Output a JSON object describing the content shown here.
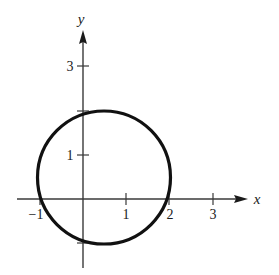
{
  "figure": {
    "colors": {
      "axis": "#3a3a3a",
      "curve": "#111111",
      "text": "#1a1a1a"
    }
  },
  "axes": {
    "x_label": "x",
    "y_label": "y",
    "x_ticks": [
      {
        "value": -1,
        "label": "−1"
      },
      {
        "value": 1,
        "label": "1"
      },
      {
        "value": 2,
        "label": "2"
      },
      {
        "value": 3,
        "label": "3"
      }
    ],
    "y_ticks": [
      {
        "value": 1,
        "label": "1"
      },
      {
        "value": 3,
        "label": "3"
      }
    ],
    "unlabeled_y_ticks": [
      2,
      -1
    ]
  },
  "curve": {
    "type": "circle",
    "center": [
      0.5,
      0.5
    ],
    "radius": 1.58,
    "intercepts": {
      "x": [
        -1,
        2
      ],
      "y": [
        -1,
        2
      ]
    }
  }
}
